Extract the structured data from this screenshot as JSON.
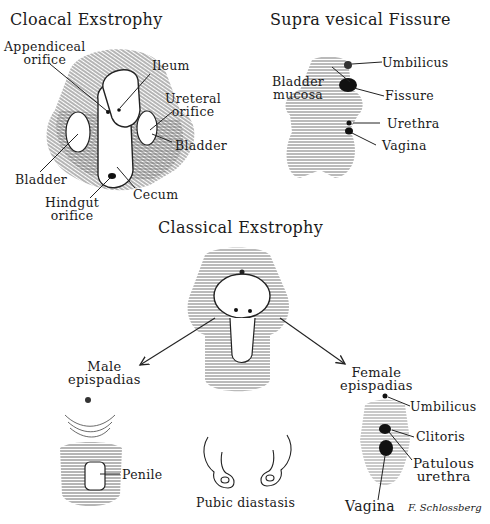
{
  "panels": {
    "cloacal": {
      "title": "Cloacal Exstrophy",
      "labels": {
        "appendiceal": "Appendiceal",
        "appendiceal2": "orifice",
        "ileum": "Ileum",
        "ureteral": "Ureteral",
        "ureteral2": "orifice",
        "bladder_right": "Bladder",
        "bladder_left": "Bladder",
        "cecum": "Cecum",
        "hindgut": "Hindgut",
        "hindgut2": "orifice"
      }
    },
    "supravesical": {
      "title": "Supra vesical Fissure",
      "labels": {
        "umbilicus": "Umbilicus",
        "bladder_mucosa": "Bladder",
        "bladder_mucosa2": "mucosa",
        "fissure": "Fissure",
        "urethra": "Urethra",
        "vagina": "Vagina"
      }
    },
    "classical": {
      "title": "Classical Exstrophy"
    },
    "male": {
      "title": "Male",
      "title2": "epispadias",
      "labels": {
        "penile": "Penile"
      }
    },
    "pubic": {
      "label": "Pubic diastasis"
    },
    "female": {
      "title": "Female",
      "title2": "epispadias",
      "labels": {
        "umbilicus": "Umbilicus",
        "clitoris": "Clitoris",
        "patulous": "Patulous",
        "patulous2": "urethra",
        "vagina": "Vagina"
      }
    }
  },
  "signature": "F. Schlossberg"
}
